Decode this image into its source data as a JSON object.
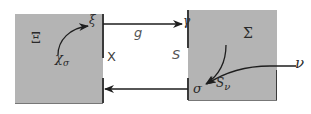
{
  "diagram": {
    "left_system": {
      "name": "Ξ",
      "state_label": "ξ",
      "curve_label": "χ",
      "curve_label_sub": "σ",
      "color": "#b4b4b4"
    },
    "right_system": {
      "name": "Σ",
      "state_label": "γ",
      "output_label": "σ",
      "curve_label": "S",
      "curve_label_sub": "ν",
      "color": "#b4b4b4"
    },
    "external_label": "ν",
    "forward_map": "g",
    "left_gap_label": "X",
    "right_gap_label": "S"
  }
}
